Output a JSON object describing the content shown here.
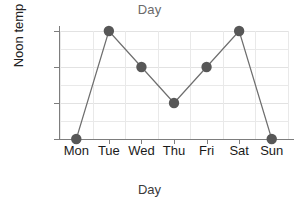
{
  "chart_data": {
    "type": "line",
    "title": "Day",
    "xlabel": "Day",
    "ylabel": "Noon temp",
    "categories": [
      "Mon",
      "Tue",
      "Wed",
      "Thu",
      "Fri",
      "Sat",
      "Sun"
    ],
    "values": [
      14,
      17,
      16,
      15,
      16,
      17,
      14
    ],
    "series": [
      {
        "name": "Noon temp",
        "values": [
          14,
          17,
          16,
          15,
          16,
          17,
          14
        ]
      }
    ],
    "ylim": [
      14,
      17
    ],
    "yticks": [
      14,
      15,
      16,
      17
    ],
    "ytick_labels": [
      "14",
      "15",
      "16",
      "17"
    ],
    "minor_ytick_step": 0.5,
    "grid": true,
    "legend": false,
    "marker": "circle",
    "marker_color": "#575757",
    "line_color": "#6e6e6e",
    "grid_color": "#e9e9e9",
    "axis_color": "#7d7d7d",
    "title_color": "#6a6a6a",
    "label_color": "#1a1a1a",
    "points": [
      {
        "x": "Mon",
        "y": 14
      },
      {
        "x": "Tue",
        "y": 17
      },
      {
        "x": "Wed",
        "y": 16
      },
      {
        "x": "Thu",
        "y": 15
      },
      {
        "x": "Fri",
        "y": 16
      },
      {
        "x": "Sat",
        "y": 17
      },
      {
        "x": "Sun",
        "y": 14
      }
    ]
  }
}
